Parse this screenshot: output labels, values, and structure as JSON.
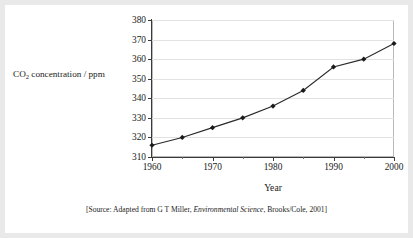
{
  "page": {
    "background_color": "#ffffff",
    "surround_color": "#e9e9e9"
  },
  "chart_data": {
    "type": "line",
    "title": "",
    "xlabel": "Year",
    "ylabel_text": "CO",
    "ylabel_sub": "2",
    "ylabel_rest": " concentration / ppm",
    "ylabel_full": "CO2 concentration / ppm",
    "x": [
      1960,
      1965,
      1970,
      1975,
      1980,
      1985,
      1990,
      1995,
      2000
    ],
    "values": [
      316,
      320,
      325,
      330,
      336,
      344,
      356,
      360,
      368
    ],
    "xlim": [
      1960,
      2000
    ],
    "ylim": [
      310,
      380
    ],
    "xticks": [
      1960,
      1970,
      1980,
      1990,
      2000
    ],
    "xticklabels": [
      "1960",
      "1970",
      "1980",
      "1990",
      "2000"
    ],
    "xticks_minor": [
      1965,
      1975,
      1985,
      1995
    ],
    "yticks": [
      310,
      320,
      330,
      340,
      350,
      360,
      370,
      380
    ],
    "yticklabels": [
      "310",
      "320",
      "330",
      "340",
      "350",
      "360",
      "370",
      "380"
    ],
    "grid": "horizontal",
    "grid_color": "#e2e2e2",
    "legend": "none",
    "marker": "diamond",
    "marker_color": "#1a1a1a",
    "line_color": "#2a2a2a",
    "axis_color": "#3a3a3a"
  },
  "source": {
    "prefix": "[Source: Adapted from G T Miller, ",
    "italic": "Environmental Science",
    "suffix": ", Brooks/Cole, 2001]",
    "full": "[Source: Adapted from G T Miller, Environmental Science, Brooks/Cole, 2001]"
  }
}
